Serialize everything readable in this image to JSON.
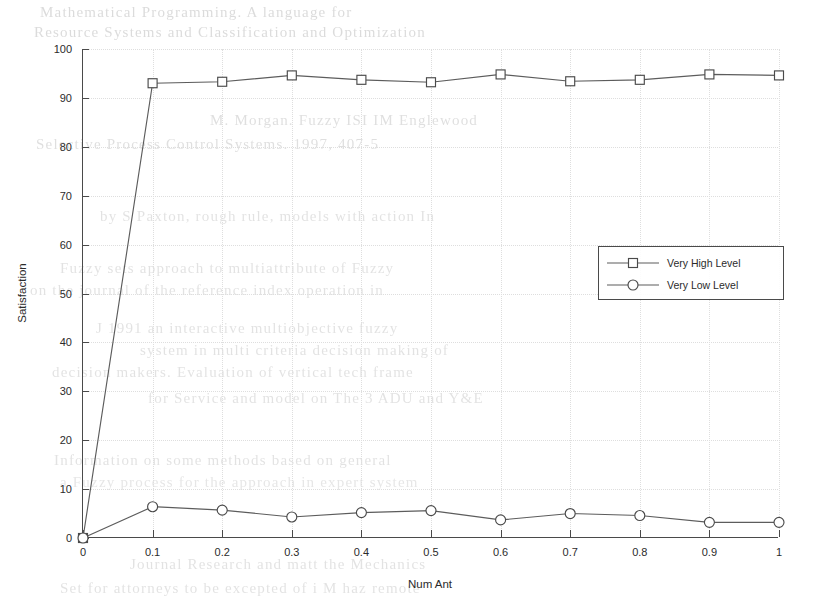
{
  "bleed_text": {
    "lines": [
      {
        "text": "Mathematical Programming. A language for",
        "x": 40,
        "y": 4,
        "size": 15,
        "opacity": 0.5
      },
      {
        "text": "Resource Systems and Classification and Optimization",
        "x": 34,
        "y": 24,
        "size": 15,
        "opacity": 0.5
      },
      {
        "text": "M. Morgan. Fuzzy ISI IM Englewood",
        "x": 210,
        "y": 112,
        "size": 15,
        "opacity": 0.45
      },
      {
        "text": "Selective Process Control Systems. 1997, 407-5",
        "x": 36,
        "y": 136,
        "size": 15,
        "opacity": 0.45
      },
      {
        "text": "by S Paxton, rough rule, models with action In",
        "x": 100,
        "y": 208,
        "size": 15,
        "opacity": 0.4
      },
      {
        "text": "Fuzzy sets approach to multiattribute of Fuzzy",
        "x": 60,
        "y": 260,
        "size": 15,
        "opacity": 0.4
      },
      {
        "text": "on the journal of the reference index operation in",
        "x": 30,
        "y": 282,
        "size": 15,
        "opacity": 0.4
      },
      {
        "text": "J 1991 an interactive multiobjective fuzzy",
        "x": 96,
        "y": 320,
        "size": 15,
        "opacity": 0.4
      },
      {
        "text": "system in multi criteria decision making of",
        "x": 140,
        "y": 342,
        "size": 15,
        "opacity": 0.4
      },
      {
        "text": "decision makers. Evaluation of vertical tech frame",
        "x": 52,
        "y": 364,
        "size": 15,
        "opacity": 0.4
      },
      {
        "text": "for Service and model on The 3 ADU and Y&E",
        "x": 148,
        "y": 390,
        "size": 15,
        "opacity": 0.4
      },
      {
        "text": "Information on some methods based on general",
        "x": 54,
        "y": 452,
        "size": 15,
        "opacity": 0.4
      },
      {
        "text": "a Fuzzy process for the approach in expert system",
        "x": 60,
        "y": 474,
        "size": 15,
        "opacity": 0.35
      },
      {
        "text": "Journal Research and matt the Mechanics",
        "x": 130,
        "y": 556,
        "size": 15,
        "opacity": 0.4
      },
      {
        "text": "Set for attorneys to be excepted of i  M haz remote",
        "x": 60,
        "y": 580,
        "size": 15,
        "opacity": 0.4
      }
    ]
  },
  "chart_data": {
    "type": "line",
    "title": "",
    "xlabel": "Num Ant",
    "ylabel": "Satisfaction",
    "x": [
      0,
      0.1,
      0.2,
      0.3,
      0.4,
      0.5,
      0.6,
      0.7,
      0.8,
      0.9,
      1
    ],
    "xlim": [
      0,
      1
    ],
    "ylim": [
      0,
      100
    ],
    "xticks": [
      0,
      0.1,
      0.2,
      0.3,
      0.4,
      0.5,
      0.6,
      0.7,
      0.8,
      0.9,
      1
    ],
    "xtick_labels": [
      "0",
      "0.1",
      "0.2",
      "0.3",
      "0.4",
      "0.5",
      "0.6",
      "0.7",
      "0.8",
      "0.9",
      "1"
    ],
    "yticks": [
      0,
      10,
      20,
      30,
      40,
      50,
      60,
      70,
      80,
      90,
      100
    ],
    "ytick_labels": [
      "0",
      "10",
      "20",
      "30",
      "40",
      "50",
      "60",
      "70",
      "80",
      "90",
      "100"
    ],
    "grid": true,
    "legend_position": "center-right",
    "series": [
      {
        "name": "Very High Level",
        "marker": "square",
        "values": [
          0,
          93.0,
          93.3,
          94.6,
          93.7,
          93.2,
          94.8,
          93.4,
          93.7,
          94.8,
          94.6
        ]
      },
      {
        "name": "Very Low Level",
        "marker": "circle",
        "values": [
          0,
          6.4,
          5.7,
          4.3,
          5.2,
          5.6,
          3.7,
          5.0,
          4.6,
          3.2,
          3.2
        ]
      }
    ]
  },
  "legend": {
    "entries": [
      {
        "label": "Very High Level",
        "marker": "square"
      },
      {
        "label": "Very Low Level",
        "marker": "circle"
      }
    ]
  },
  "colors": {
    "line": "#5c5c5c",
    "marker_stroke": "#4a4a4a",
    "axis": "#4a4a4a",
    "grid": "#dedede",
    "text": "#2b2b2b",
    "background": "#ffffff"
  }
}
